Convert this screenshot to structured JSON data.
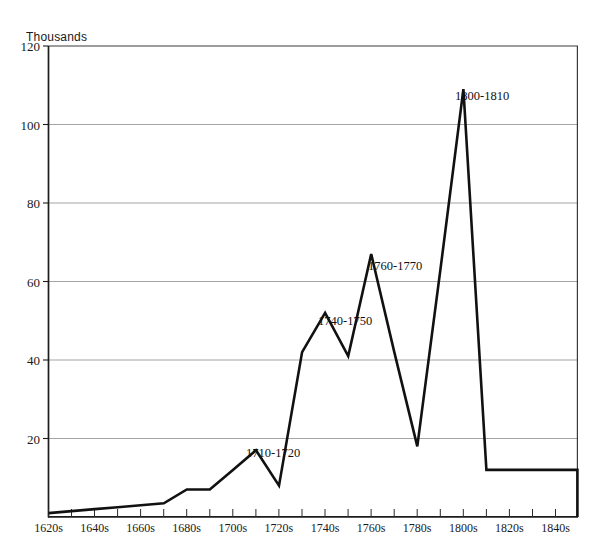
{
  "chart_data": {
    "type": "line",
    "title": "",
    "ylabel": "Thousands",
    "xlabel": "",
    "ylim": [
      0,
      120
    ],
    "yticks": [
      0,
      20,
      40,
      60,
      80,
      100,
      120
    ],
    "ytick_labels": [
      "",
      "20",
      "40",
      "60",
      "80",
      "100",
      "120"
    ],
    "grid": true,
    "legend": "none",
    "xtick_labels": [
      "1620s",
      "1640s",
      "1660s",
      "1680s",
      "1700s",
      "1720s",
      "1740s",
      "1760s",
      "1780s",
      "1800s",
      "1820s",
      "1840s"
    ],
    "categories": [
      "1620s",
      "1630s",
      "1640s",
      "1650s",
      "1660s",
      "1670s",
      "1680s",
      "1690s",
      "1700s",
      "1710s",
      "1720s",
      "1730s",
      "1740s",
      "1750s",
      "1760s",
      "1770s",
      "1780s",
      "1790s",
      "1800s",
      "1810s",
      "1820s",
      "1830s",
      "1840s"
    ],
    "values": [
      1,
      1.5,
      2,
      2.5,
      3,
      3.5,
      7,
      7,
      12,
      17,
      8,
      42,
      52,
      41,
      67,
      42,
      18,
      63,
      109,
      12,
      12,
      12,
      12
    ],
    "annotations": [
      {
        "text": "1710-1720",
        "value": 17,
        "category": "1710s"
      },
      {
        "text": "1740-1750",
        "value": 52,
        "category": "1740s"
      },
      {
        "text": "1760-1770",
        "value": 67,
        "category": "1760s"
      },
      {
        "text": "1800-1810",
        "value": 109,
        "category": "1800s"
      }
    ]
  },
  "axis": {
    "y_title": "Thousands",
    "y_labels": {
      "t120": "120",
      "t100": "100",
      "t80": "80",
      "t60": "60",
      "t40": "40",
      "t20": "20"
    },
    "x_labels": {
      "d1620": "1620s",
      "d1640": "1640s",
      "d1660": "1660s",
      "d1680": "1680s",
      "d1700": "1700s",
      "d1720": "1720s",
      "d1740": "1740s",
      "d1760": "1760s",
      "d1780": "1780s",
      "d1800": "1800s",
      "d1820": "1820s",
      "d1840": "1840s"
    }
  },
  "annotations": {
    "a1": "1710-1720",
    "a2": "1740-1750",
    "a3": "1760-1770",
    "a4": "1800-1810"
  },
  "colors": {
    "line": "#111111",
    "grid": "#9a9a9a",
    "axis": "#1c1c1c",
    "background": "#ffffff"
  }
}
